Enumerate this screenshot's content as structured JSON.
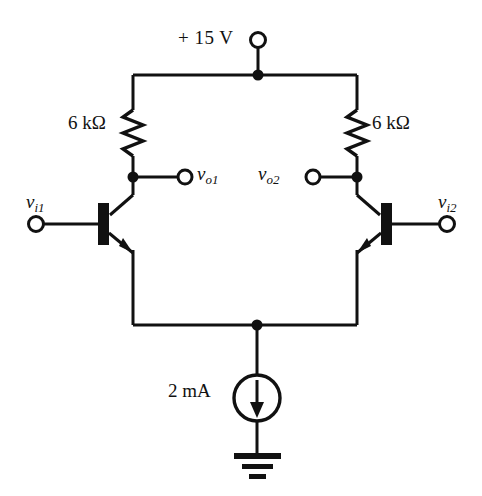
{
  "diagram": {
    "type": "circuit-schematic",
    "stroke_color": "#111111",
    "background_color": "#ffffff"
  },
  "supply": {
    "label": "+ 15 V",
    "terminal": "open-circle-terminal"
  },
  "resistors": {
    "left": {
      "label_value": "6",
      "label_unit": "kΩ",
      "label": "6 kΩ",
      "symbol": "zigzag-resistor"
    },
    "right": {
      "label_value": "6",
      "label_unit": "kΩ",
      "label": "6 kΩ",
      "symbol": "zigzag-resistor"
    }
  },
  "outputs": {
    "left": {
      "var": "v",
      "subscript": "o1",
      "label": "vo1"
    },
    "right": {
      "var": "v",
      "subscript": "o2",
      "label": "vo2"
    }
  },
  "inputs": {
    "left": {
      "var": "v",
      "subscript": "i1",
      "label": "vi1"
    },
    "right": {
      "var": "v",
      "subscript": "i2",
      "label": "vi2"
    }
  },
  "current_source": {
    "label": "2 mA",
    "value": "2",
    "unit": "mA",
    "direction": "down",
    "symbol": "circle-arrow-current-source"
  },
  "ground": {
    "symbol": "earth-ground",
    "bars": 3
  },
  "transistors": {
    "left": {
      "type": "npn",
      "orientation": "base-left"
    },
    "right": {
      "type": "npn",
      "orientation": "base-right"
    }
  },
  "nodes": {
    "supply_rail_junction": "junction-dot",
    "left_collector_junction": "junction-dot",
    "right_collector_junction": "junction-dot",
    "tail_junction": "junction-dot"
  }
}
